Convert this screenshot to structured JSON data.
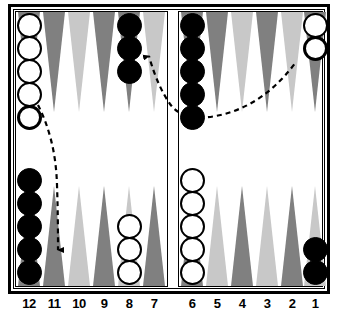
{
  "board": {
    "title": "Backgammon board diagram",
    "point_labels_left": [
      "12",
      "11",
      "10",
      "9",
      "8",
      "7"
    ],
    "point_labels_right": [
      "6",
      "5",
      "4",
      "3",
      "2",
      "1"
    ],
    "colors": {
      "point_dark": "#808080",
      "point_light": "#c8c8c8",
      "checker_black": "#000000",
      "checker_white": "#ffffff",
      "frame": "#000000",
      "background": "#ffffff"
    },
    "stacks": [
      {
        "id": "top-12",
        "point": "12",
        "color": "white",
        "count": 5,
        "quadrant": "top-left"
      },
      {
        "id": "top-8",
        "point": "8",
        "color": "black",
        "count": 3,
        "quadrant": "top-left"
      },
      {
        "id": "top-6",
        "point": "6",
        "color": "black",
        "count": 5,
        "quadrant": "top-right"
      },
      {
        "id": "top-1",
        "point": "1",
        "color": "white",
        "count": 2,
        "quadrant": "top-right"
      },
      {
        "id": "bot-12",
        "point": "12",
        "color": "black",
        "count": 5,
        "quadrant": "bottom-left"
      },
      {
        "id": "bot-8",
        "point": "8",
        "color": "white",
        "count": 3,
        "quadrant": "bottom-left"
      },
      {
        "id": "bot-6",
        "point": "6",
        "color": "white",
        "count": 5,
        "quadrant": "bottom-right"
      },
      {
        "id": "bot-1",
        "point": "1",
        "color": "black",
        "count": 2,
        "quadrant": "bottom-right"
      }
    ],
    "moves": [
      {
        "id": "move-12-to-11",
        "from": "12",
        "to": "11",
        "style": "dashed",
        "direction": "down"
      },
      {
        "id": "move-6-to-8",
        "from": "6",
        "to": "8",
        "style": "dashed",
        "direction": "up-left"
      },
      {
        "id": "move-6-to-1",
        "from": "6",
        "to": "1",
        "style": "dashed",
        "direction": "up-right"
      }
    ]
  }
}
